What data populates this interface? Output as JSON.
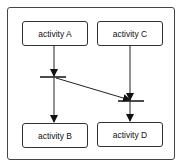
{
  "diagram": {
    "type": "activity-diagram",
    "nodes": [
      {
        "id": "A",
        "label": "activity A"
      },
      {
        "id": "B",
        "label": "activity B"
      },
      {
        "id": "C",
        "label": "activity C"
      },
      {
        "id": "D",
        "label": "activity D"
      }
    ],
    "sync_bars": [
      {
        "id": "fork1",
        "description": "fork after activity A"
      },
      {
        "id": "join1",
        "description": "join before activity D"
      }
    ],
    "edges": [
      {
        "from": "A",
        "to": "fork1"
      },
      {
        "from": "fork1",
        "to": "B"
      },
      {
        "from": "fork1",
        "to": "join1"
      },
      {
        "from": "C",
        "to": "join1"
      },
      {
        "from": "join1",
        "to": "D"
      }
    ]
  }
}
